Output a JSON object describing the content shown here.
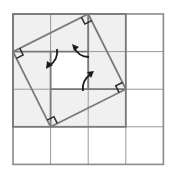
{
  "figure": {
    "grid": {
      "rows": 4,
      "cols": 4
    },
    "shaded_region": {
      "rows": 3,
      "cols": 3
    },
    "tilted_square_vertices": [
      "top (2,0)",
      "right (3,2)",
      "bottom (1,3)",
      "left (0,1)"
    ],
    "inner_square": {
      "from": "(1,1)",
      "to": "(2,2)"
    },
    "right_angle_markers": 4,
    "rotation_arrows": 3,
    "colors": {
      "background": "#ffffff",
      "shaded": "#f0f0f0",
      "grid_line": "#9a9a9a",
      "bold_line": "#7a7a7a",
      "marker": "#2a2a2a",
      "arrow": "#1a1a1a"
    }
  }
}
